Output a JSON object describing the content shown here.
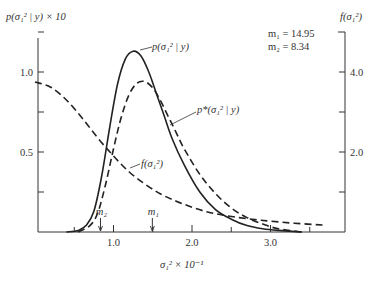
{
  "chart_data": {
    "type": "line",
    "title": "",
    "xlabel": "σ₁² × 10⁻¹",
    "ylabel_left": "p(σ₁² | y) × 10",
    "ylabel_right": "f(σ₁²)",
    "x_ticks": [
      "1.0",
      "2.0",
      "3.0"
    ],
    "y_left_ticks": [
      "0.5",
      "1.0"
    ],
    "y_right_ticks": [
      "2.0",
      "4.0"
    ],
    "xlim": [
      0,
      3.9
    ],
    "ylim_left": [
      0,
      1.4
    ],
    "ylim_right": [
      0,
      5.6
    ],
    "annotations": {
      "m1_label": "m₁ = 14.95",
      "m2_label": "m₂ =   8.34",
      "m1_marker": "m₁",
      "m2_marker": "m₂",
      "m1_x": 1.495,
      "m2_x": 0.834
    },
    "series": [
      {
        "name": "p(σ₁² | y)",
        "style": "solid",
        "axis": "left",
        "x": [
          0.4,
          0.55,
          0.65,
          0.75,
          0.85,
          0.95,
          1.05,
          1.15,
          1.25,
          1.35,
          1.45,
          1.55,
          1.65,
          1.75,
          1.9,
          2.1,
          2.3,
          2.5,
          2.7,
          2.9,
          3.1,
          3.4
        ],
        "values": [
          0.0,
          0.01,
          0.04,
          0.13,
          0.35,
          0.65,
          0.92,
          1.08,
          1.13,
          1.1,
          1.0,
          0.86,
          0.72,
          0.58,
          0.42,
          0.25,
          0.14,
          0.08,
          0.04,
          0.02,
          0.01,
          0.0
        ]
      },
      {
        "name": "p*(σ₁² | y)",
        "style": "dashed",
        "axis": "left",
        "x": [
          0.55,
          0.7,
          0.8,
          0.9,
          1.0,
          1.1,
          1.2,
          1.3,
          1.4,
          1.5,
          1.6,
          1.7,
          1.8,
          1.9,
          2.1,
          2.3,
          2.5,
          2.7,
          2.9,
          3.1,
          3.4
        ],
        "values": [
          0.0,
          0.04,
          0.12,
          0.3,
          0.52,
          0.72,
          0.86,
          0.93,
          0.94,
          0.9,
          0.82,
          0.72,
          0.62,
          0.52,
          0.36,
          0.24,
          0.15,
          0.09,
          0.05,
          0.02,
          0.0
        ]
      },
      {
        "name": "f(σ₁²)",
        "style": "dashed",
        "axis": "right",
        "x": [
          0.0,
          0.2,
          0.4,
          0.6,
          0.8,
          1.0,
          1.2,
          1.4,
          1.6,
          1.8,
          2.0,
          2.2,
          2.4,
          2.6,
          2.8,
          3.0,
          3.3,
          3.7
        ],
        "values": [
          3.75,
          3.62,
          3.3,
          2.85,
          2.35,
          1.9,
          1.5,
          1.2,
          0.95,
          0.77,
          0.62,
          0.5,
          0.42,
          0.36,
          0.31,
          0.27,
          0.22,
          0.17
        ]
      }
    ],
    "curve_labels": {
      "p": "p(σ₁² | y)",
      "pstar": "p*(σ₁² | y)",
      "f": "f(σ₁²)"
    },
    "grid": false,
    "legend_position": "none (inline labels)"
  }
}
